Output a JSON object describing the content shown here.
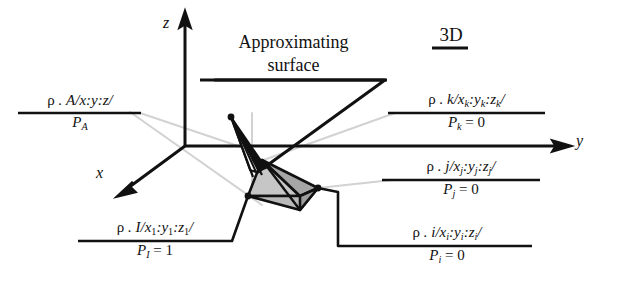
{
  "figure": {
    "title_3d": "3D",
    "approximating": {
      "line1": "Approximating",
      "line2": "surface"
    },
    "axes": {
      "z": "z",
      "x": "x",
      "y": "y"
    },
    "labels": {
      "A": {
        "numerator_rho": "ρ",
        "numerator_rest": " . A/x:y:z/",
        "denominator": "P",
        "denominator_sub": "A",
        "denominator_rest": ""
      },
      "k": {
        "numerator_rho": "ρ",
        "numerator_rest": " . k/x",
        "denominator": "P",
        "denominator_sub": "k",
        "denominator_rest": " = 0"
      },
      "j": {
        "numerator_rho": "ρ",
        "numerator_rest": " . j/x",
        "denominator": "P",
        "denominator_sub": "j",
        "denominator_rest": " = 0"
      },
      "i": {
        "numerator_rho": "ρ",
        "numerator_rest": " . i/x",
        "denominator": "P",
        "denominator_sub": "i",
        "denominator_rest": " = 0"
      },
      "I": {
        "numerator_rho": "ρ",
        "numerator_rest": " . I/x",
        "denominator": "P",
        "denominator_sub": "I",
        "denominator_rest": " = 1"
      }
    },
    "label_text_full": {
      "A": "ρ . A/x:y:z/  over  P_A",
      "k": "ρ . k/x_k:y_k:z_k/  over  P_k = 0",
      "j": "ρ . j/x_j:y_j:z_j/  over  P_j = 0",
      "i": "ρ . i/x_i:y_i:z_i/  over  P_i = 0",
      "I": "ρ . I/x_1:y_1:z_1/  over  P_I = 1"
    },
    "colors": {
      "ink": "#111111",
      "leader_gray": "#cfcfcf",
      "surface_fill_light": "#c9c9c9",
      "surface_fill_mid": "#b4b4b4",
      "surface_fill_dark": "#9e9e9e",
      "background": "#ffffff"
    }
  }
}
